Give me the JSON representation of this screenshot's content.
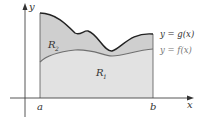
{
  "figure": {
    "axes": {
      "x_label": "x",
      "y_label": "y"
    },
    "bounds": {
      "a": "a",
      "b": "b"
    },
    "curves": {
      "g": {
        "label": "y = g(x)",
        "color": "#222222"
      },
      "f": {
        "label": "y = f(x)",
        "color": "#6f6f6f"
      }
    },
    "regions": {
      "R1": {
        "label": "R",
        "sub": "1",
        "fill": "#e2e2e2"
      },
      "R2": {
        "label": "R",
        "sub": "2",
        "fill": "#cfcfcf"
      }
    }
  }
}
